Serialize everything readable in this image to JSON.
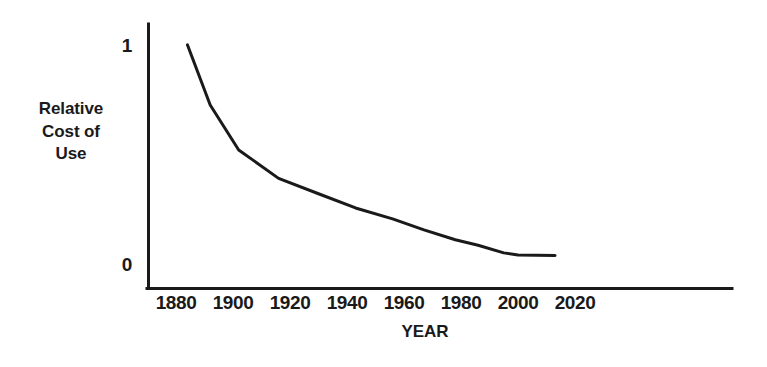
{
  "chart_data": {
    "type": "line",
    "title": "",
    "xlabel": "YEAR",
    "ylabel": "Relative Cost of Use",
    "ylabel_lines": [
      "Relative",
      "Cost of",
      "Use"
    ],
    "xlim": [
      1872,
      2027
    ],
    "ylim": [
      0,
      1.06
    ],
    "xticks": [
      1880,
      1900,
      1920,
      1940,
      1960,
      1980,
      2000,
      2020
    ],
    "xtick_labels": [
      "1880",
      "1900",
      "1920",
      "1940",
      "1960",
      "1980",
      "2000",
      "2020"
    ],
    "yticks": [
      0,
      1
    ],
    "ytick_labels": [
      "0",
      "1"
    ],
    "grid": false,
    "legend": false,
    "line_color": "#1a1a1a",
    "line_width_px": 3,
    "series": [
      {
        "name": "Relative Cost of Use",
        "x": [
          1884,
          1892,
          1902,
          1916,
          1930,
          1943,
          1956,
          1967,
          1978,
          1986,
          1995,
          2000,
          2013
        ],
        "y": [
          1.01,
          0.735,
          0.53,
          0.4,
          0.33,
          0.265,
          0.215,
          0.165,
          0.12,
          0.095,
          0.06,
          0.05,
          0.048
        ]
      }
    ]
  },
  "axes": {
    "x_axis_line_color": "#1a1a1a",
    "y_axis_line_color": "#1a1a1a"
  }
}
